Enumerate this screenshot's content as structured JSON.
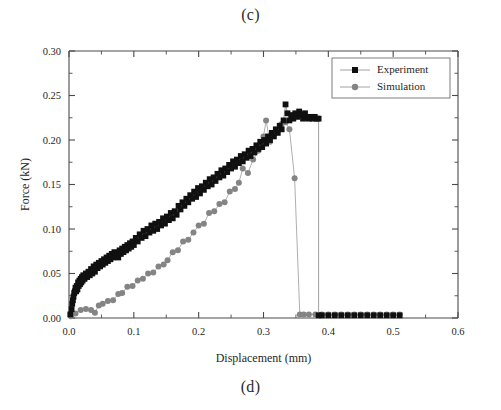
{
  "figure": {
    "caption_top": "(c)",
    "caption_bottom": "(d)"
  },
  "chart_data": {
    "type": "scatter",
    "title": "",
    "xlabel": "Displacement (mm)",
    "ylabel": "Force (kN)",
    "xlim": [
      0.0,
      0.6
    ],
    "ylim": [
      0.0,
      0.3
    ],
    "xticks": [
      0.0,
      0.1,
      0.2,
      0.3,
      0.4,
      0.5,
      0.6
    ],
    "xtick_labels": [
      "0.0",
      "0.1",
      "0.2",
      "0.3",
      "0.4",
      "0.5",
      "0.6"
    ],
    "yticks": [
      0.0,
      0.05,
      0.1,
      0.15,
      0.2,
      0.25,
      0.3
    ],
    "ytick_labels": [
      "0.00",
      "0.05",
      "0.10",
      "0.15",
      "0.20",
      "0.25",
      "0.30"
    ],
    "x_minor_per_major": 2,
    "y_minor_per_major": 2,
    "grid": false,
    "legend_position": "top-right",
    "legend_entries": [
      "Experiment",
      "Simulation"
    ],
    "series": [
      {
        "name": "Experiment",
        "marker": "square",
        "color": "#101010",
        "x": [
          0.002,
          0.004,
          0.005,
          0.006,
          0.007,
          0.008,
          0.009,
          0.01,
          0.011,
          0.012,
          0.013,
          0.014,
          0.015,
          0.016,
          0.017,
          0.018,
          0.019,
          0.02,
          0.021,
          0.022,
          0.024,
          0.026,
          0.028,
          0.03,
          0.032,
          0.034,
          0.036,
          0.038,
          0.04,
          0.042,
          0.044,
          0.046,
          0.048,
          0.05,
          0.052,
          0.054,
          0.056,
          0.058,
          0.06,
          0.062,
          0.064,
          0.066,
          0.068,
          0.07,
          0.072,
          0.074,
          0.076,
          0.078,
          0.08,
          0.082,
          0.084,
          0.086,
          0.088,
          0.09,
          0.092,
          0.094,
          0.096,
          0.098,
          0.1,
          0.103,
          0.106,
          0.109,
          0.112,
          0.115,
          0.118,
          0.121,
          0.124,
          0.127,
          0.13,
          0.133,
          0.136,
          0.139,
          0.142,
          0.145,
          0.148,
          0.151,
          0.154,
          0.157,
          0.16,
          0.163,
          0.166,
          0.169,
          0.172,
          0.175,
          0.178,
          0.181,
          0.184,
          0.187,
          0.19,
          0.193,
          0.196,
          0.199,
          0.202,
          0.205,
          0.208,
          0.211,
          0.214,
          0.217,
          0.22,
          0.223,
          0.226,
          0.229,
          0.232,
          0.235,
          0.238,
          0.241,
          0.244,
          0.247,
          0.25,
          0.253,
          0.256,
          0.259,
          0.262,
          0.265,
          0.268,
          0.271,
          0.274,
          0.277,
          0.28,
          0.283,
          0.286,
          0.289,
          0.292,
          0.295,
          0.298,
          0.301,
          0.304,
          0.307,
          0.31,
          0.313,
          0.316,
          0.319,
          0.322,
          0.325,
          0.328,
          0.331,
          0.334,
          0.337,
          0.34,
          0.343,
          0.346,
          0.349,
          0.352,
          0.355,
          0.358,
          0.361,
          0.364,
          0.367,
          0.37,
          0.373,
          0.376,
          0.379,
          0.382,
          0.385,
          0.385,
          0.39,
          0.4,
          0.41,
          0.42,
          0.43,
          0.44,
          0.45,
          0.46,
          0.47,
          0.48,
          0.49,
          0.5,
          0.51
        ],
        "y": [
          0.004,
          0.01,
          0.016,
          0.02,
          0.024,
          0.028,
          0.03,
          0.034,
          0.03,
          0.036,
          0.032,
          0.04,
          0.036,
          0.042,
          0.038,
          0.044,
          0.04,
          0.046,
          0.042,
          0.048,
          0.044,
          0.05,
          0.046,
          0.052,
          0.048,
          0.055,
          0.05,
          0.058,
          0.052,
          0.06,
          0.056,
          0.062,
          0.058,
          0.064,
          0.06,
          0.066,
          0.062,
          0.068,
          0.064,
          0.07,
          0.066,
          0.072,
          0.068,
          0.074,
          0.07,
          0.073,
          0.068,
          0.076,
          0.072,
          0.078,
          0.074,
          0.08,
          0.076,
          0.082,
          0.078,
          0.084,
          0.08,
          0.086,
          0.082,
          0.09,
          0.086,
          0.094,
          0.09,
          0.098,
          0.092,
          0.1,
          0.096,
          0.104,
          0.098,
          0.106,
          0.1,
          0.108,
          0.104,
          0.112,
          0.106,
          0.114,
          0.11,
          0.118,
          0.112,
          0.12,
          0.116,
          0.126,
          0.122,
          0.13,
          0.126,
          0.134,
          0.13,
          0.138,
          0.134,
          0.142,
          0.136,
          0.146,
          0.14,
          0.148,
          0.144,
          0.152,
          0.148,
          0.156,
          0.15,
          0.158,
          0.154,
          0.162,
          0.158,
          0.166,
          0.16,
          0.168,
          0.164,
          0.172,
          0.168,
          0.176,
          0.17,
          0.178,
          0.174,
          0.182,
          0.176,
          0.184,
          0.18,
          0.188,
          0.182,
          0.19,
          0.186,
          0.194,
          0.19,
          0.198,
          0.192,
          0.2,
          0.196,
          0.204,
          0.2,
          0.208,
          0.204,
          0.212,
          0.208,
          0.216,
          0.212,
          0.222,
          0.24,
          0.23,
          0.222,
          0.228,
          0.224,
          0.23,
          0.226,
          0.232,
          0.228,
          0.224,
          0.23,
          0.226,
          0.224,
          0.226,
          0.224,
          0.226,
          0.224,
          0.224,
          0.003,
          0.003,
          0.003,
          0.003,
          0.003,
          0.003,
          0.003,
          0.003,
          0.003,
          0.003,
          0.003,
          0.003,
          0.003,
          0.003
        ]
      },
      {
        "name": "Simulation",
        "marker": "circle",
        "color": "#848484",
        "x": [
          0.003,
          0.01,
          0.018,
          0.026,
          0.034,
          0.04,
          0.046,
          0.052,
          0.06,
          0.068,
          0.076,
          0.082,
          0.09,
          0.098,
          0.106,
          0.114,
          0.122,
          0.13,
          0.138,
          0.146,
          0.152,
          0.16,
          0.168,
          0.176,
          0.184,
          0.192,
          0.2,
          0.208,
          0.216,
          0.224,
          0.232,
          0.24,
          0.248,
          0.256,
          0.262,
          0.268,
          0.276,
          0.284,
          0.292,
          0.3,
          0.304,
          0.31,
          0.316,
          0.322,
          0.328,
          0.334,
          0.34,
          0.348,
          0.356,
          0.362,
          0.37,
          0.38,
          0.39,
          0.4,
          0.41,
          0.42,
          0.43,
          0.44,
          0.45,
          0.46,
          0.47,
          0.48,
          0.49,
          0.5,
          0.51
        ],
        "y": [
          0.002,
          0.005,
          0.009,
          0.01,
          0.009,
          0.006,
          0.014,
          0.016,
          0.019,
          0.02,
          0.027,
          0.028,
          0.035,
          0.036,
          0.042,
          0.044,
          0.05,
          0.051,
          0.058,
          0.06,
          0.065,
          0.074,
          0.076,
          0.086,
          0.088,
          0.096,
          0.104,
          0.106,
          0.118,
          0.12,
          0.128,
          0.13,
          0.142,
          0.145,
          0.152,
          0.168,
          0.163,
          0.178,
          0.188,
          0.204,
          0.222,
          0.198,
          0.206,
          0.21,
          0.218,
          0.22,
          0.212,
          0.157,
          0.004,
          0.004,
          0.004,
          0.004,
          0.004,
          0.004,
          0.004,
          0.004,
          0.004,
          0.004,
          0.004,
          0.004,
          0.004,
          0.004,
          0.004,
          0.004,
          0.004
        ]
      }
    ]
  }
}
